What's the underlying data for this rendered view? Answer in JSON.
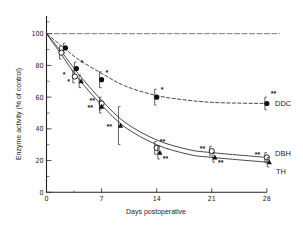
{
  "chart_data": {
    "type": "line",
    "title": "",
    "xlabel": "Days postoperative",
    "ylabel": "Enzyme activity (% of control)",
    "xlim": [
      0,
      28
    ],
    "ylim": [
      0,
      100
    ],
    "xticks": [
      0,
      7,
      14,
      21,
      28
    ],
    "yticks": [
      0,
      20,
      40,
      60,
      80,
      100
    ],
    "grid": false,
    "reference_line": {
      "y": 100,
      "style": "dashed"
    },
    "legend": "inline labels at right end of curves",
    "series": [
      {
        "name": "DDC",
        "marker": "filled-circle",
        "curve_style": "dashed",
        "points": [
          {
            "x": 2.4,
            "y": 91,
            "err": 3,
            "sig": ""
          },
          {
            "x": 3.8,
            "y": 78,
            "err": 4,
            "sig": "*"
          },
          {
            "x": 7,
            "y": 71,
            "err": 5,
            "sig": "*"
          },
          {
            "x": 14,
            "y": 60,
            "err": 5,
            "sig": "*"
          },
          {
            "x": 28,
            "y": 56,
            "err": 4,
            "sig": "**"
          }
        ],
        "curve": [
          [
            0,
            100
          ],
          [
            2,
            92
          ],
          [
            4,
            84
          ],
          [
            7,
            75
          ],
          [
            10,
            67
          ],
          [
            14,
            61
          ],
          [
            18,
            58
          ],
          [
            22,
            56.5
          ],
          [
            28,
            56
          ]
        ]
      },
      {
        "name": "DBH",
        "marker": "open-circle",
        "curve_style": "solid",
        "points": [
          {
            "x": 1.9,
            "y": 88,
            "err": 4,
            "sig": ""
          },
          {
            "x": 3.6,
            "y": 73,
            "err": 4,
            "sig": "*"
          },
          {
            "x": 7,
            "y": 56,
            "err": 4,
            "sig": "**"
          },
          {
            "x": 14,
            "y": 28,
            "err": 4,
            "sig": "**"
          },
          {
            "x": 21,
            "y": 26,
            "err": 3,
            "sig": "**"
          },
          {
            "x": 28,
            "y": 22,
            "err": 3,
            "sig": "**"
          }
        ],
        "curve": [
          [
            0,
            100
          ],
          [
            2,
            88
          ],
          [
            4,
            75
          ],
          [
            7,
            58
          ],
          [
            10,
            44
          ],
          [
            14,
            33
          ],
          [
            18,
            27
          ],
          [
            21,
            25
          ],
          [
            28,
            22
          ]
        ]
      },
      {
        "name": "TH",
        "marker": "filled-triangle",
        "curve_style": "solid",
        "points": [
          {
            "x": 4.4,
            "y": 70,
            "err": 4,
            "sig": "*"
          },
          {
            "x": 7,
            "y": 54,
            "err": 4,
            "sig": "**"
          },
          {
            "x": 9.4,
            "y": 42,
            "err": 12,
            "sig": "**"
          },
          {
            "x": 14.4,
            "y": 25,
            "err": 4,
            "sig": "**"
          },
          {
            "x": 21.4,
            "y": 22,
            "err": 3,
            "sig": "**"
          },
          {
            "x": 28.3,
            "y": 19,
            "err": 3,
            "sig": ""
          }
        ],
        "curve": [
          [
            0,
            100
          ],
          [
            2,
            86
          ],
          [
            4,
            72
          ],
          [
            7,
            55
          ],
          [
            10,
            41
          ],
          [
            14,
            30
          ],
          [
            18,
            24
          ],
          [
            21,
            22
          ],
          [
            28,
            19
          ]
        ]
      }
    ]
  },
  "labels": {
    "xlabel": "Days postoperative",
    "ylabel": "Enzyme activity (% of control)",
    "ddc": "DDC",
    "dbh": "DBH",
    "th": "TH"
  }
}
